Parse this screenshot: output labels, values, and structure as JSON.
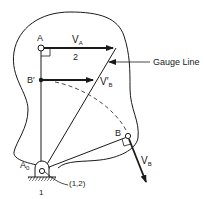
{
  "diagram": {
    "type": "mechanism-velocity-diagram",
    "labels": {
      "point_a": "A",
      "velocity_a": "V",
      "velocity_a_sub": "A",
      "link_number": "2",
      "gauge_line": "Gauge Line",
      "point_b_prime": "B′",
      "velocity_b_prime": "V′",
      "velocity_b_prime_sub": "B",
      "point_b": "B",
      "velocity_b": "V",
      "velocity_b_sub": "B",
      "pivot": "A",
      "pivot_sub": "0",
      "ground_number": "1",
      "instant_center": "(1,2)"
    },
    "colors": {
      "stroke": "#1a1a1a",
      "background": "#ffffff"
    }
  }
}
